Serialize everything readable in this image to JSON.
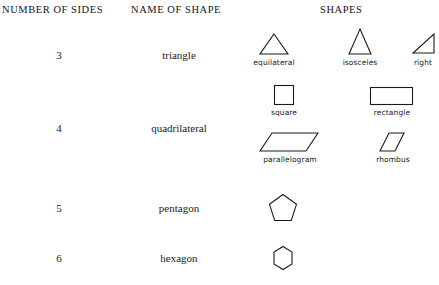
{
  "page": {
    "background": "#ffffff",
    "ink": "#1a1a1a",
    "clipped_top_text": "polygons"
  },
  "headers": {
    "sides": "NUMBER OF SIDES",
    "name": "NAME OF SHAPE",
    "shapes": "SHAPES"
  },
  "rows": [
    {
      "sides": "3",
      "name": "triangle",
      "figures": [
        {
          "label": "equilateral",
          "shape": "equilateral-triangle"
        },
        {
          "label": "isosceles",
          "shape": "isosceles-triangle"
        },
        {
          "label": "right",
          "shape": "right-triangle"
        }
      ]
    },
    {
      "sides": "4",
      "name": "quadrilateral",
      "figures": [
        {
          "label": "square",
          "shape": "square"
        },
        {
          "label": "rectangle",
          "shape": "rectangle"
        },
        {
          "label": "parallelogram",
          "shape": "parallelogram"
        },
        {
          "label": "rhombus",
          "shape": "rhombus"
        }
      ]
    },
    {
      "sides": "5",
      "name": "pentagon",
      "figures": [
        {
          "label": "",
          "shape": "pentagon"
        }
      ]
    },
    {
      "sides": "6",
      "name": "hexagon",
      "figures": [
        {
          "label": "",
          "shape": "hexagon"
        }
      ]
    }
  ]
}
